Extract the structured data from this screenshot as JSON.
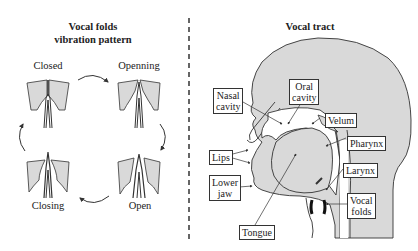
{
  "left_panel": {
    "title_line1": "Vocal folds",
    "title_line2": "vibration pattern",
    "states": [
      {
        "label": "Closed"
      },
      {
        "label": "Openning"
      },
      {
        "label": "Open"
      },
      {
        "label": "Closing"
      }
    ]
  },
  "right_panel": {
    "title": "Vocal tract",
    "labels": {
      "nasal_cavity_1": "Nasal",
      "nasal_cavity_2": "cavity",
      "oral_cavity_1": "Oral",
      "oral_cavity_2": "cavity",
      "velum": "Velum",
      "pharynx": "Pharynx",
      "lips": "Lips",
      "lower_jaw_1": "Lower",
      "lower_jaw_2": "jaw",
      "larynx": "Larynx",
      "vocal_folds_1": "Vocal",
      "vocal_folds_2": "folds",
      "tongue": "Tongue"
    }
  },
  "colors": {
    "fill": "#d9d9d9",
    "stroke": "#333333",
    "folds": "#111111"
  }
}
